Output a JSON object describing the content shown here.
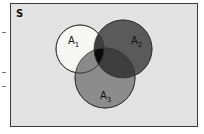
{
  "diagram": {
    "type": "venn",
    "universe_label": "S",
    "sets": [
      {
        "name": "A",
        "subscript": "1",
        "color": "#f7f7f3"
      },
      {
        "name": "A",
        "subscript": "2",
        "color": "#5a5a5a"
      },
      {
        "name": "A",
        "subscript": "3",
        "color": "#8c8c8c"
      }
    ],
    "overlap_colors": {
      "a1_a2": "#3e3e3e",
      "a1_a3": "#8a8a8a",
      "a2_a3": "#3e3e3e",
      "a1_a2_a3": "#0a0a0a"
    },
    "background_color": "#e3e3e3"
  }
}
